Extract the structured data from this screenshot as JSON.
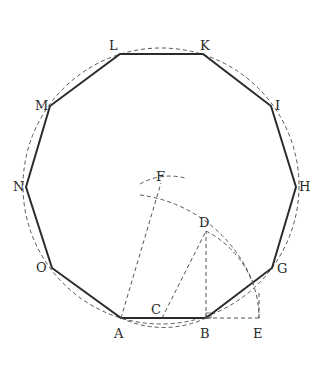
{
  "figure": {
    "points": {
      "A": {
        "label": "A",
        "x": 121,
        "y": 318
      },
      "B": {
        "label": "B",
        "x": 206,
        "y": 318
      },
      "G": {
        "label": "G",
        "x": 272,
        "y": 268
      },
      "H": {
        "label": "H",
        "x": 296,
        "y": 187
      },
      "I": {
        "label": "I",
        "x": 271,
        "y": 106
      },
      "K": {
        "label": "K",
        "x": 203,
        "y": 54
      },
      "L": {
        "label": "L",
        "x": 120,
        "y": 54
      },
      "M": {
        "label": "M",
        "x": 50,
        "y": 106
      },
      "N": {
        "label": "N",
        "x": 26,
        "y": 187
      },
      "O": {
        "label": "O",
        "x": 52,
        "y": 268
      },
      "C": {
        "label": "C",
        "x": 162,
        "y": 318
      },
      "D": {
        "label": "D",
        "x": 206,
        "y": 231
      },
      "E": {
        "label": "E",
        "x": 259,
        "y": 318
      },
      "F": {
        "label": "F",
        "x": 161,
        "y": 183
      }
    },
    "labels": {
      "A": "A",
      "B": "B",
      "C": "C",
      "D": "D",
      "E": "E",
      "F": "F",
      "G": "G",
      "H": "H",
      "I": "I",
      "K": "K",
      "L": "L",
      "M": "M",
      "N": "N",
      "O": "O"
    },
    "circumcircle": {
      "cx": 161,
      "cy": 186,
      "r": 138
    },
    "stroke_color": "#2b2b2b",
    "dash_color": "#555555"
  }
}
